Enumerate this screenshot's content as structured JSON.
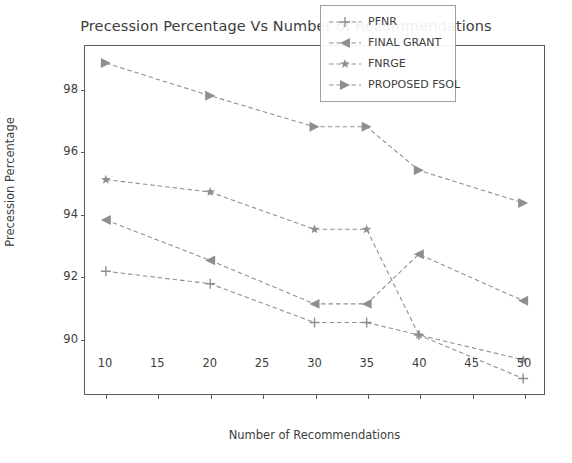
{
  "chart_data": {
    "type": "line",
    "title": "Precession Percentage Vs Number of Recommendations",
    "xlabel": "Number of Recommendations",
    "ylabel": "Precession Percentage",
    "x": [
      10,
      20,
      30,
      35,
      40,
      50
    ],
    "xlim": [
      8,
      52
    ],
    "ylim": [
      88.2,
      99.4
    ],
    "xticks": [
      10,
      15,
      20,
      25,
      30,
      35,
      40,
      45,
      50
    ],
    "yticks": [
      90,
      92,
      94,
      96,
      98
    ],
    "grid": false,
    "legend_position": "upper right",
    "series": [
      {
        "name": "PFNR",
        "marker": "plus",
        "color": "#8f8f8f",
        "linestyle": "dashed",
        "values": [
          92.15,
          91.75,
          90.5,
          90.5,
          90.1,
          88.7
        ]
      },
      {
        "name": "FINAL GRANT",
        "marker": "triangle-left",
        "color": "#8f8f8f",
        "linestyle": "dashed",
        "values": [
          93.8,
          92.5,
          91.1,
          91.1,
          92.7,
          91.2
        ]
      },
      {
        "name": "FNRGE",
        "marker": "star",
        "color": "#8f8f8f",
        "linestyle": "dashed",
        "values": [
          95.1,
          94.7,
          93.5,
          93.5,
          90.1,
          89.3
        ]
      },
      {
        "name": "PROPOSED FSOL",
        "marker": "triangle-right",
        "color": "#8f8f8f",
        "linestyle": "dashed",
        "values": [
          98.85,
          97.8,
          96.8,
          96.8,
          95.4,
          94.35
        ]
      }
    ]
  },
  "legend": {
    "items": [
      {
        "label": "PFNR"
      },
      {
        "label": "FINAL GRANT"
      },
      {
        "label": "FNRGE"
      },
      {
        "label": "PROPOSED FSOL"
      }
    ]
  },
  "axes": {
    "ytick_labels": [
      "90",
      "92",
      "94",
      "96",
      "98"
    ],
    "xtick_labels": [
      "10",
      "15",
      "20",
      "25",
      "30",
      "35",
      "40",
      "45",
      "50"
    ]
  }
}
